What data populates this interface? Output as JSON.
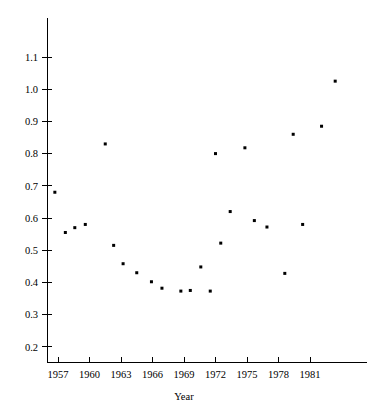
{
  "chart_data": {
    "type": "scatter",
    "title": "",
    "subtitle": "",
    "xlabel": "Year",
    "ylabel": "",
    "grid": false,
    "legend": null,
    "legend_position": "none",
    "xlim": [
      1955.8,
      1985.0
    ],
    "ylim": [
      0.155,
      1.145
    ],
    "xticks": [
      1957,
      1960,
      1963,
      1966,
      1969,
      1972,
      1975,
      1978,
      1981
    ],
    "xtick_labels": [
      "1957",
      "1960",
      "1963",
      "1966",
      "1969",
      "1972",
      "1975",
      "1978",
      "1981"
    ],
    "yticks": [
      0.2,
      0.3,
      0.4,
      0.5,
      0.6,
      0.7,
      0.8,
      0.9,
      1.0,
      1.1
    ],
    "ytick_labels": [
      "0.2",
      "0.3",
      "0.4",
      "0.5",
      "0.6",
      "0.7",
      "0.8",
      "0.9",
      "1.0",
      "1.1"
    ],
    "marker": "square",
    "marker_color": "#000000",
    "marker_size": 3,
    "x": [
      1956.7,
      1957.7,
      1958.6,
      1959.6,
      1961.5,
      1962.3,
      1963.2,
      1964.5,
      1965.9,
      1966.9,
      1968.7,
      1969.6,
      1970.6,
      1971.5,
      1972.0,
      1972.5,
      1973.4,
      1974.8,
      1975.7,
      1976.9,
      1978.6,
      1979.4,
      1980.3,
      1982.1,
      1983.4
    ],
    "y": [
      0.68,
      0.555,
      0.57,
      0.58,
      0.83,
      0.515,
      0.458,
      0.43,
      0.402,
      0.382,
      0.373,
      0.375,
      0.448,
      0.373,
      0.8,
      0.522,
      0.62,
      0.818,
      0.592,
      0.572,
      0.428,
      0.86,
      0.58,
      0.885,
      1.025
    ],
    "points": [
      {
        "year": 1956.7,
        "value": 0.68
      },
      {
        "year": 1957.7,
        "value": 0.555
      },
      {
        "year": 1958.6,
        "value": 0.57
      },
      {
        "year": 1959.6,
        "value": 0.58
      },
      {
        "year": 1961.5,
        "value": 0.83
      },
      {
        "year": 1962.3,
        "value": 0.515
      },
      {
        "year": 1963.2,
        "value": 0.458
      },
      {
        "year": 1964.5,
        "value": 0.43
      },
      {
        "year": 1965.9,
        "value": 0.402
      },
      {
        "year": 1966.9,
        "value": 0.382
      },
      {
        "year": 1968.7,
        "value": 0.373
      },
      {
        "year": 1969.6,
        "value": 0.375
      },
      {
        "year": 1970.6,
        "value": 0.448
      },
      {
        "year": 1971.5,
        "value": 0.373
      },
      {
        "year": 1972.0,
        "value": 0.8
      },
      {
        "year": 1972.5,
        "value": 0.522
      },
      {
        "year": 1973.4,
        "value": 0.62
      },
      {
        "year": 1974.8,
        "value": 0.818
      },
      {
        "year": 1975.7,
        "value": 0.592
      },
      {
        "year": 1976.9,
        "value": 0.572
      },
      {
        "year": 1978.6,
        "value": 0.428
      },
      {
        "year": 1979.4,
        "value": 0.86
      },
      {
        "year": 1980.3,
        "value": 0.58
      },
      {
        "year": 1982.1,
        "value": 0.885
      },
      {
        "year": 1983.4,
        "value": 1.025
      }
    ]
  }
}
